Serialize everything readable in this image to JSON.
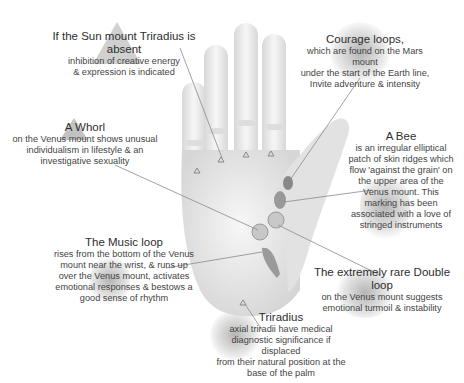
{
  "diagram": {
    "colors": {
      "background": "#ffffff",
      "hand": "#e6e6e6",
      "text": "#3a3a3a",
      "leader_line": "#8a8a8a"
    },
    "annotations": [
      {
        "id": "sun-triradius",
        "title": "If the Sun mount Triradius is absent",
        "lines": [
          "inhibition of creative energy",
          "& expression is indicated"
        ]
      },
      {
        "id": "courage-loops",
        "title": "Courage loops,",
        "lines": [
          "which are found on the Mars mount",
          "under the start of the Earth line,",
          "Invite adventure & intensity"
        ]
      },
      {
        "id": "whorl",
        "title": "A Whorl",
        "lines": [
          "on the Venus mount shows unusual",
          "individualism in lifestyle & an",
          "investigative sexuality"
        ]
      },
      {
        "id": "bee",
        "title": "A Bee",
        "lines": [
          "is an irregular elliptical",
          "patch of skin ridges which",
          "flow 'against the grain' on",
          "the upper area of the",
          "Venus mount.  This",
          "marking has been",
          "associated with a love of",
          "stringed instruments"
        ]
      },
      {
        "id": "music-loop",
        "title": "The Music loop",
        "lines": [
          "rises from the bottom of the Venus",
          "mount near the wrist, & runs up",
          "over the Venus mount, activates",
          "emotional responses & bestows a",
          "good sense of rhythm"
        ]
      },
      {
        "id": "double-loop",
        "title": "The extremely rare Double loop",
        "lines": [
          "on the Venus mount suggests",
          "emotional turmoil & instability"
        ]
      },
      {
        "id": "triradius",
        "title": "Triradius",
        "lines": [
          "axial triradii have medical",
          "diagnostic significance if displaced",
          "from their natural position at the",
          "base of the palm"
        ]
      }
    ]
  }
}
